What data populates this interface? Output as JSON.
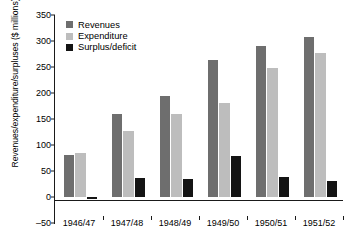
{
  "chart_data": {
    "type": "bar",
    "title": "",
    "xlabel": "",
    "ylabel": "Revenues/expenditure/surpluses ($ millions)",
    "categories": [
      "1946/47",
      "1947/48",
      "1948/49",
      "1949/50",
      "1950/51",
      "1951/52"
    ],
    "series": [
      {
        "name": "Revenues",
        "color": "#6e6e6e",
        "values": [
          80,
          160,
          194,
          263,
          291,
          307
        ]
      },
      {
        "name": "Expenditure",
        "color": "#bdbdbd",
        "values": [
          84,
          126,
          159,
          181,
          248,
          277
        ]
      },
      {
        "name": "Surplus/deficit",
        "color": "#141414",
        "values": [
          -4,
          36,
          35,
          79,
          38,
          31
        ]
      }
    ],
    "ylim": [
      -50,
      350
    ],
    "yticks": [
      -50,
      0,
      50,
      100,
      150,
      200,
      250,
      300,
      350
    ],
    "ytick_labels": [
      "–50",
      "0",
      "50",
      "100",
      "150",
      "200",
      "250",
      "300",
      "350"
    ],
    "grid": false,
    "legend_position": "top-left"
  },
  "legend": {
    "items": [
      {
        "label": "Revenues",
        "color": "#6e6e6e"
      },
      {
        "label": "Expenditure",
        "color": "#bdbdbd"
      },
      {
        "label": "Surplus/deficit",
        "color": "#141414"
      }
    ]
  },
  "axis": {
    "line_color": "#1a1a1a"
  }
}
